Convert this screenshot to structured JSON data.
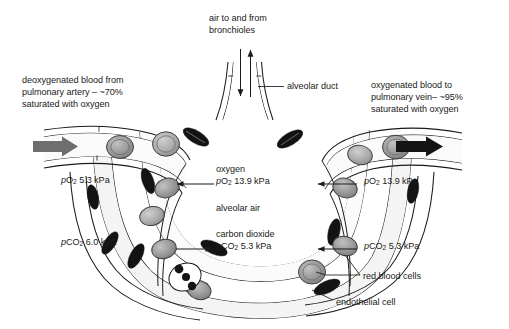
{
  "figure": {
    "colors": {
      "text": "#1a1a1a",
      "outline": "#1a1a1a",
      "deoxygenated_arrow": "#6e6e6e",
      "oxygenated_arrow": "#141414",
      "red_blood_cell_fill": "#9a9a9a",
      "endothelial_nucleus_fill": "#131313",
      "alveolar_air_fill": "#ffffff",
      "capillary_fill": "#f2f2f2"
    }
  },
  "labels": {
    "deoxygenated_blood": "deoxygenated blood from\npulmonary artery – ~70%\nsaturated with oxygen",
    "air_to_and_from_bronchioles": "air to and from\nbronchioles",
    "oxygenated_blood": "oxygenated blood to\npulmonary vein– ~95%\nsaturated with oxygen",
    "alveolar_duct": "alveolar duct",
    "oxygen": "oxygen",
    "alveolar_air": "alveolar air",
    "carbon_dioxide": "carbon dioxide",
    "red_blood_cells": "red blood cells",
    "endothelial_cell": "endothelial cell"
  },
  "measurements": {
    "po2_deoxygenated_blood": {
      "species": "pO",
      "subscript": "2",
      "value": "5.3",
      "unit": "kPa",
      "text": "5.3 kPa"
    },
    "pco2_deoxygenated_blood": {
      "species": "pCO",
      "subscript": "2",
      "value": "6.0",
      "unit": "kPa",
      "text": "6.0 kPa"
    },
    "po2_alveolar_air": {
      "species": "pO",
      "subscript": "2",
      "value": "13.9",
      "unit": "kPa",
      "text": "13.9 kPa"
    },
    "pco2_alveolar_air": {
      "species": "pCO",
      "subscript": "2",
      "value": "5.3",
      "unit": "kPa",
      "text": "5.3 kPa"
    },
    "po2_oxygenated_blood": {
      "species": "pO",
      "subscript": "2",
      "value": "13.9",
      "unit": "kPa",
      "text": "13.9 kPa"
    },
    "pco2_oxygenated_blood": {
      "species": "pCO",
      "subscript": "2",
      "value": "5.3",
      "unit": "kPa",
      "text": "5.3 kPa"
    }
  },
  "annotations": {
    "blood_flow_in": "deoxygenated blood inflow arrow",
    "blood_flow_out": "oxygenated blood outflow arrow",
    "air_in": "air inflow arrow (down)",
    "air_out": "air outflow arrow (up)"
  }
}
